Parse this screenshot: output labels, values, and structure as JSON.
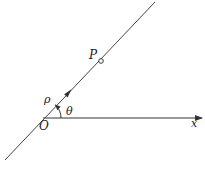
{
  "diagram": {
    "colors": {
      "stroke": "#333333",
      "text": "#222222",
      "background": "#ffffff"
    },
    "origin": {
      "label": "O",
      "x": 43,
      "y": 118
    },
    "polar_axis": {
      "label": "x",
      "direction": "right"
    },
    "ray": {
      "label": "ρ",
      "direction_arrow": true
    },
    "angle": {
      "label": "θ",
      "from": "polar_axis",
      "to": "ray"
    },
    "point": {
      "label": "P",
      "marker": "hollow-circle"
    }
  }
}
